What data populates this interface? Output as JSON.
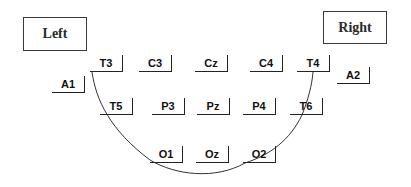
{
  "labels": {
    "left": "Left",
    "right": "Right"
  },
  "electrodes": {
    "A1": "A1",
    "T3": "T3",
    "C3": "C3",
    "Cz": "Cz",
    "C4": "C4",
    "T4": "T4",
    "A2": "A2",
    "T5": "T5",
    "P3": "P3",
    "Pz": "Pz",
    "P4": "P4",
    "T6": "T6",
    "O1": "O1",
    "Oz": "Oz",
    "O2": "O2"
  },
  "colors": {
    "outline": "#222222",
    "background": "#ffffff"
  }
}
